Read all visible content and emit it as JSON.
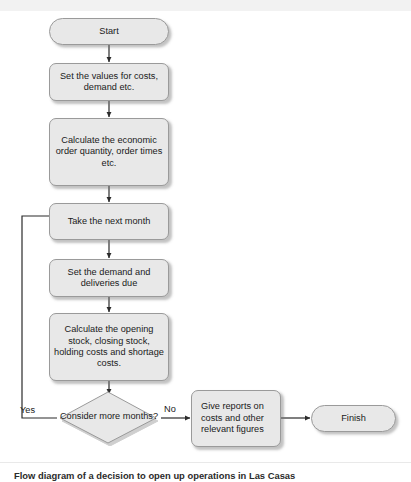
{
  "figure": {
    "type": "flowchart",
    "caption": "Flow diagram of a decision to open up operations in Las Casas",
    "colors": {
      "node_fill": "#e8e8e8",
      "node_border": "#9a9a9a",
      "connector": "#2b2b2b",
      "text": "#1a1a1a",
      "band": "#f2f2f2"
    }
  },
  "nodes": [
    {
      "id": "start",
      "shape": "terminator",
      "label": "Start"
    },
    {
      "id": "set-values",
      "shape": "process",
      "label": "Set the values for costs, demand etc."
    },
    {
      "id": "calc-eoq",
      "shape": "process",
      "label": "Calculate the economic order quantity, order times etc."
    },
    {
      "id": "next-month",
      "shape": "process",
      "label": "Take the next month"
    },
    {
      "id": "set-demand",
      "shape": "process",
      "label": "Set the demand and deliveries due"
    },
    {
      "id": "calc-stock",
      "shape": "process",
      "label": "Calculate the opening stock, closing stock, holding costs and shortage costs."
    },
    {
      "id": "decision",
      "shape": "decision",
      "label": "Consider more months?"
    },
    {
      "id": "reports",
      "shape": "process",
      "label": "Give reports on costs and other relevant figures"
    },
    {
      "id": "finish",
      "shape": "terminator",
      "label": "Finish"
    }
  ],
  "edges": [
    {
      "from": "start",
      "to": "set-values",
      "label": ""
    },
    {
      "from": "set-values",
      "to": "calc-eoq",
      "label": ""
    },
    {
      "from": "calc-eoq",
      "to": "next-month",
      "label": ""
    },
    {
      "from": "next-month",
      "to": "set-demand",
      "label": ""
    },
    {
      "from": "set-demand",
      "to": "calc-stock",
      "label": ""
    },
    {
      "from": "calc-stock",
      "to": "decision",
      "label": ""
    },
    {
      "from": "decision",
      "to": "next-month",
      "label": "Yes"
    },
    {
      "from": "decision",
      "to": "reports",
      "label": "No"
    },
    {
      "from": "reports",
      "to": "finish",
      "label": ""
    }
  ],
  "edge_labels": {
    "yes": "Yes",
    "no": "No"
  }
}
